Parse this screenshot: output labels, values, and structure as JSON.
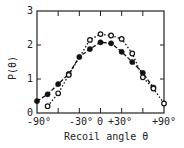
{
  "chart_data": {
    "type": "line",
    "title": "",
    "xlabel": "Recoil angle θ",
    "ylabel": "P(θ)",
    "xlim": [
      -90,
      90
    ],
    "ylim": [
      0,
      3
    ],
    "x_tick_labels": [
      "-90°",
      "-30°",
      "0",
      "+30°",
      "+90°"
    ],
    "y_tick_labels": [
      "0",
      "1",
      "2",
      "3"
    ],
    "grid": false,
    "legend": null,
    "x": [
      -90,
      -75,
      -60,
      -45,
      -30,
      -15,
      0,
      15,
      30,
      45,
      60,
      75,
      90
    ],
    "series": [
      {
        "name": "filled circles (dashed fit)",
        "marker": "filled-circle",
        "line": "dashed",
        "points": [
          [
            -90,
            0.35
          ],
          [
            -75,
            0.55
          ],
          [
            -60,
            0.85
          ],
          [
            -45,
            1.15
          ],
          [
            -30,
            1.65
          ],
          [
            -15,
            1.88
          ],
          [
            0,
            2.08
          ],
          [
            15,
            2.05
          ],
          [
            30,
            1.8
          ],
          [
            45,
            1.5
          ],
          [
            60,
            1.18
          ],
          [
            75,
            0.75
          ]
        ]
      },
      {
        "name": "open circles (dotted fit)",
        "marker": "open-circle",
        "line": "dotted",
        "points": [
          [
            -75,
            0.2
          ],
          [
            -60,
            0.58
          ],
          [
            -45,
            1.12
          ],
          [
            -15,
            2.15
          ],
          [
            0,
            2.32
          ],
          [
            15,
            2.28
          ],
          [
            30,
            2.18
          ],
          [
            45,
            1.75
          ],
          [
            60,
            1.05
          ],
          [
            75,
            0.72
          ],
          [
            90,
            0.28
          ]
        ]
      }
    ]
  },
  "labels": {
    "xlabel": "Recoil angle θ",
    "ylabel": "P(θ)",
    "x_ticks": [
      "-90°",
      "-30°",
      "0",
      "+30°",
      "+90°"
    ],
    "y_ticks": [
      "0",
      "1",
      "2",
      "3"
    ]
  }
}
